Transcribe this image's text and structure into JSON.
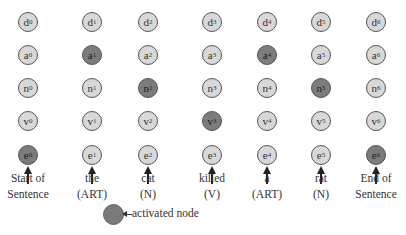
{
  "diagram": {
    "columns": [
      {
        "index": 0,
        "x": 28,
        "word": "Start of",
        "tag": "Sentence"
      },
      {
        "index": 1,
        "x": 92,
        "word": "the",
        "tag": "(ART)"
      },
      {
        "index": 2,
        "x": 148,
        "word": "cat",
        "tag": "(N)"
      },
      {
        "index": 3,
        "x": 212,
        "word": "killed",
        "tag": "(V)"
      },
      {
        "index": 4,
        "x": 267,
        "word": "a",
        "tag": "(ART)"
      },
      {
        "index": 5,
        "x": 321,
        "word": "rat",
        "tag": "(N)"
      },
      {
        "index": 6,
        "x": 376,
        "word": "End of",
        "tag": "Sentence"
      }
    ],
    "rows": [
      {
        "letter": "d",
        "y": 22
      },
      {
        "letter": "a",
        "y": 55
      },
      {
        "letter": "n",
        "y": 88
      },
      {
        "letter": "v",
        "y": 121
      },
      {
        "letter": "e",
        "y": 155
      }
    ],
    "activated_nodes": [
      "a1",
      "n2",
      "v3",
      "a4",
      "n5",
      "e0",
      "e6"
    ],
    "colors": {
      "node_fill": "#d8d8d8",
      "activated_fill": "#7c7c7c",
      "border": "#555555"
    },
    "legend": {
      "label": "activated node"
    }
  }
}
